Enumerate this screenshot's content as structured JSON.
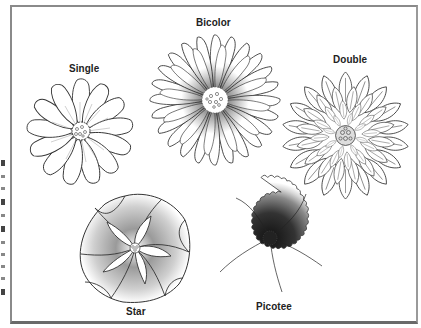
{
  "figure": {
    "flowers": [
      {
        "id": "single",
        "label": "Single"
      },
      {
        "id": "bicolor",
        "label": "Bicolor"
      },
      {
        "id": "double",
        "label": "Double"
      },
      {
        "id": "star",
        "label": "Star"
      },
      {
        "id": "picotee",
        "label": "Picotee"
      }
    ],
    "colors": {
      "outline": "#333333",
      "frame": "#8a8a8a",
      "shade_dark": "#1a1a1a",
      "shade_light": "#ffffff"
    }
  }
}
